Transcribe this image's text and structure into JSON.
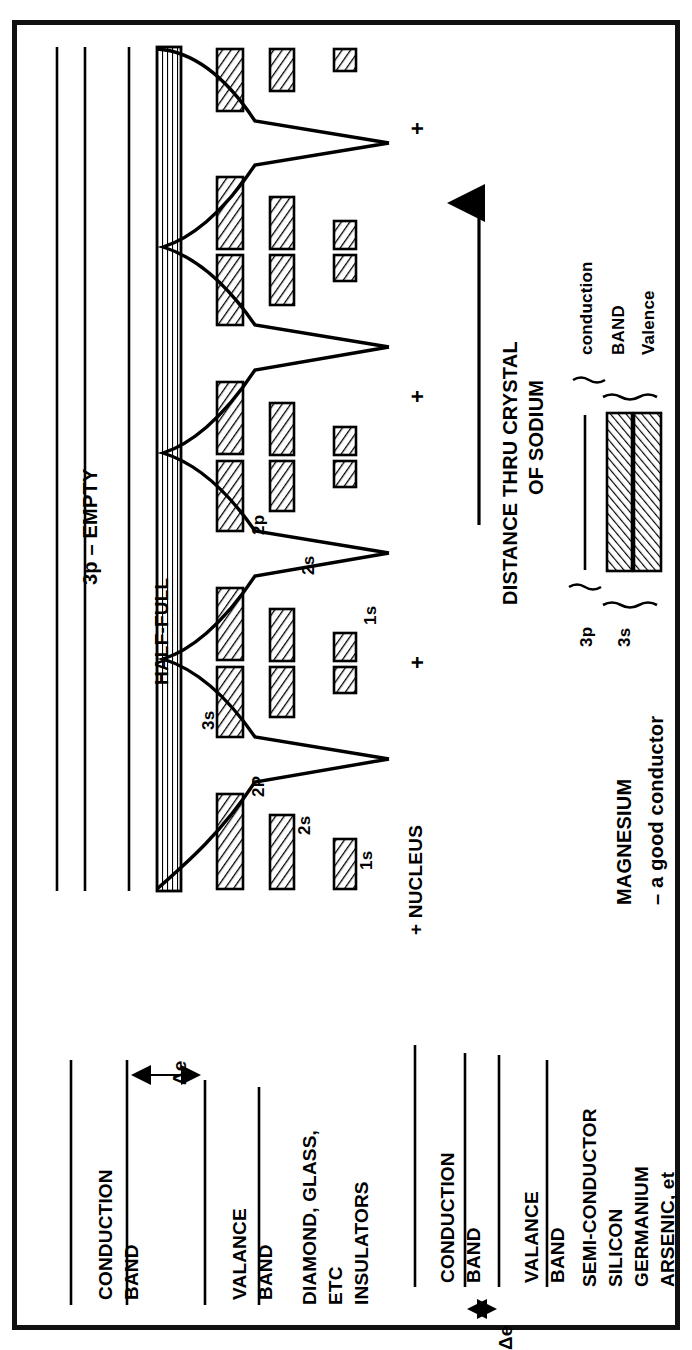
{
  "figure": {
    "type": "energy-band-diagram",
    "domain": "solid-state physics / electron energy bands"
  },
  "main_diagram": {
    "title_axis": "DISTANCE THRU CRYSTAL",
    "title_axis_line2": "OF SODIUM",
    "axis_arrow": "arrow-right",
    "bands": [
      {
        "id": "3p",
        "label": "3p – EMPTY",
        "state": "empty",
        "hatched": false
      },
      {
        "id": "3s",
        "label": "HALF-FULL",
        "state": "half-full",
        "hatched": true
      },
      {
        "id": "2p",
        "label": "2p",
        "state": "full",
        "hatched": true
      },
      {
        "id": "2s",
        "label": "2s",
        "state": "full",
        "hatched": true
      },
      {
        "id": "1s",
        "label": "1s",
        "state": "full",
        "hatched": true
      }
    ],
    "well_labels": [
      {
        "text": "3s"
      },
      {
        "text": "2P"
      },
      {
        "text": "2s"
      },
      {
        "text": "1s"
      },
      {
        "text": "2p"
      },
      {
        "text": "2s"
      },
      {
        "text": "1s"
      }
    ],
    "nucleus_label": "+ NUCLEUS",
    "nucleus_marks": [
      "+",
      "+",
      "+",
      "+"
    ],
    "num_wells": 4
  },
  "magnesium": {
    "title": "MAGNESIUM",
    "subtitle": "– a good conductor",
    "left_labels": [
      {
        "id": "3p",
        "text": "3p"
      },
      {
        "id": "3s",
        "text": "3s"
      }
    ],
    "right_labels": [
      {
        "id": "conduction",
        "text": "conduction"
      },
      {
        "id": "band",
        "text": "BAND"
      },
      {
        "id": "valence",
        "text": "Valence"
      }
    ],
    "bands": [
      {
        "id": "3p",
        "hatched": false
      },
      {
        "id": "3s-a",
        "hatched": true
      },
      {
        "id": "3s-b",
        "hatched": true
      }
    ]
  },
  "insulator": {
    "conduction_label_line1": "CONDUCTION",
    "conduction_label_line2": "BAND",
    "gap_label": "Δe",
    "valence_label_line1": "VALANCE",
    "valence_label_line2": "BAND",
    "caption_line1": "DIAMOND, GLASS,",
    "caption_line2": "ETC",
    "caption_line3": "INSULATORS",
    "gap_size": "large"
  },
  "semiconductor": {
    "conduction_label_line1": "CONDUCTION",
    "conduction_label_line2": "BAND",
    "gap_label": "Δe",
    "valence_label_line1": "VALANCE",
    "valence_label_line2": "BAND",
    "caption_line1": "SEMI-CONDUCTOR",
    "caption_line2": "SILICON",
    "caption_line3": "GERMANIUM",
    "caption_line4": "ARSENIC, et",
    "gap_size": "small"
  },
  "colors": {
    "ink": "#000000",
    "paper": "#ffffff",
    "frame": "#111111"
  }
}
